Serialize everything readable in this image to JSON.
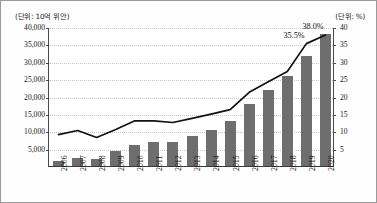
{
  "axis_units": {
    "left": "(단위: 10억 위안)",
    "right": "(단위: %)"
  },
  "chart_data": {
    "type": "bar",
    "title": "",
    "subtitle": "",
    "xlabel": "",
    "ylabel": "(단위: 10억 위안)",
    "y2label": "(단위: %)",
    "grid": true,
    "legend": "none",
    "categories": [
      "2006",
      "2007",
      "2008",
      "2009",
      "2010",
      "2011",
      "2012",
      "2013",
      "2014",
      "2015",
      "2016",
      "2017",
      "2018",
      "2019",
      "2020"
    ],
    "ylim": [
      0,
      40000
    ],
    "yticks": [
      5000,
      10000,
      15000,
      20000,
      25000,
      30000,
      35000,
      40000
    ],
    "ytick_labels": [
      "5,000",
      "10,000",
      "15,000",
      "20,000",
      "25,000",
      "30,000",
      "35,000",
      "40,000"
    ],
    "y2lim": [
      0,
      40
    ],
    "y2ticks": [
      5,
      10,
      15,
      20,
      25,
      30,
      35,
      40
    ],
    "y2tick_labels": [
      "5",
      "10",
      "15",
      "20",
      "25",
      "30",
      "35",
      "40"
    ],
    "series": [
      {
        "name": "금액",
        "type": "bar",
        "axis": "left",
        "color": "#6e6e6e",
        "values": [
          1300,
          2200,
          2100,
          4300,
          6000,
          6800,
          7000,
          8700,
          10500,
          12900,
          17800,
          21800,
          26000,
          31800,
          38000
        ]
      },
      {
        "name": "비중",
        "type": "line",
        "axis": "right",
        "color": "#111111",
        "values": [
          9.3,
          10.5,
          8.5,
          10.8,
          13.3,
          13.3,
          12.8,
          14.0,
          15.2,
          16.5,
          21.5,
          24.5,
          27.5,
          35.5,
          38.0
        ]
      }
    ],
    "annotations": [
      {
        "label": "35.5%",
        "category": "2019",
        "value": 35.5
      },
      {
        "label": "38.0%",
        "category": "2020",
        "value": 38.0
      }
    ]
  }
}
